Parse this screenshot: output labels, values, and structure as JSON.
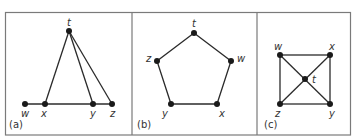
{
  "figure": {
    "colors": {
      "frame": "#7a7a7a",
      "edge": "#2b2b2b",
      "node": "#1a1a1a",
      "text": "#333333"
    },
    "panels": [
      {
        "label": "(a)",
        "nodes": [
          {
            "id": "t",
            "label": "t"
          },
          {
            "id": "w",
            "label": "w"
          },
          {
            "id": "x",
            "label": "x"
          },
          {
            "id": "y",
            "label": "y"
          },
          {
            "id": "z",
            "label": "z"
          }
        ],
        "edges": [
          [
            "w",
            "x"
          ],
          [
            "x",
            "y"
          ],
          [
            "y",
            "z"
          ],
          [
            "t",
            "x"
          ],
          [
            "t",
            "y"
          ],
          [
            "t",
            "z"
          ]
        ]
      },
      {
        "label": "(b)",
        "nodes": [
          {
            "id": "t",
            "label": "t"
          },
          {
            "id": "w",
            "label": "w"
          },
          {
            "id": "x",
            "label": "x"
          },
          {
            "id": "y",
            "label": "y"
          },
          {
            "id": "z",
            "label": "z"
          }
        ],
        "edges": [
          [
            "t",
            "w"
          ],
          [
            "w",
            "x"
          ],
          [
            "x",
            "y"
          ],
          [
            "y",
            "z"
          ],
          [
            "z",
            "t"
          ]
        ]
      },
      {
        "label": "(c)",
        "nodes": [
          {
            "id": "w",
            "label": "w"
          },
          {
            "id": "x",
            "label": "x"
          },
          {
            "id": "t",
            "label": "t"
          },
          {
            "id": "z",
            "label": "z"
          },
          {
            "id": "y",
            "label": "y"
          }
        ],
        "edges": [
          [
            "w",
            "x"
          ],
          [
            "x",
            "y"
          ],
          [
            "y",
            "z"
          ],
          [
            "z",
            "w"
          ],
          [
            "w",
            "t"
          ],
          [
            "t",
            "y"
          ],
          [
            "x",
            "t"
          ],
          [
            "t",
            "z"
          ]
        ]
      }
    ]
  }
}
